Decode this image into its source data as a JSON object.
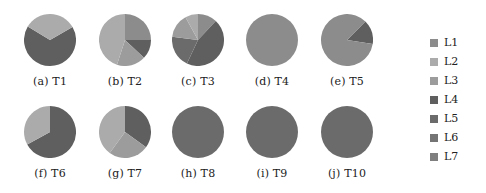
{
  "chart_data": [
    {
      "type": "pie",
      "title": "(a) T1",
      "labels": [
        "L4",
        "L2"
      ],
      "values": [
        67,
        33
      ]
    },
    {
      "type": "pie",
      "title": "(b) T2",
      "labels": [
        "L1",
        "L4",
        "L3",
        "L2"
      ],
      "values": [
        25,
        12,
        18,
        45
      ]
    },
    {
      "type": "pie",
      "title": "(c) T3",
      "labels": [
        "L1",
        "L4",
        "L5",
        "L3",
        "L2"
      ],
      "values": [
        12,
        45,
        20,
        15,
        8
      ]
    },
    {
      "type": "pie",
      "title": "(d) T4",
      "labels": [
        "L1"
      ],
      "values": [
        100
      ]
    },
    {
      "type": "pie",
      "title": "(e) T5",
      "labels": [
        "L4",
        "L1"
      ],
      "values": [
        15,
        85
      ]
    },
    {
      "type": "pie",
      "title": "(f) T6",
      "labels": [
        "L4",
        "L2"
      ],
      "values": [
        67,
        33
      ]
    },
    {
      "type": "pie",
      "title": "(g) T7",
      "labels": [
        "L4",
        "L3",
        "L2"
      ],
      "values": [
        35,
        25,
        40
      ]
    },
    {
      "type": "pie",
      "title": "(h) T8",
      "labels": [
        "L5"
      ],
      "values": [
        100
      ]
    },
    {
      "type": "pie",
      "title": "(i) T9",
      "labels": [
        "L5"
      ],
      "values": [
        100
      ]
    },
    {
      "type": "pie",
      "title": "(j) T10",
      "labels": [
        "L5"
      ],
      "values": [
        100
      ]
    }
  ],
  "legend": {
    "position": "right",
    "items": [
      {
        "label": "L1",
        "color": "#8c8c8c"
      },
      {
        "label": "L2",
        "color": "#ababab"
      },
      {
        "label": "L3",
        "color": "#9c9c9c"
      },
      {
        "label": "L4",
        "color": "#5f5f5f"
      },
      {
        "label": "L5",
        "color": "#6b6b6b"
      },
      {
        "label": "L6",
        "color": "#747474"
      },
      {
        "label": "L7",
        "color": "#7f7f7f"
      }
    ]
  },
  "layout": {
    "radius": 26,
    "positions": [
      {
        "x": 50,
        "y": 40
      },
      {
        "x": 125,
        "y": 40
      },
      {
        "x": 198,
        "y": 40
      },
      {
        "x": 272,
        "y": 40
      },
      {
        "x": 347,
        "y": 40
      },
      {
        "x": 50,
        "y": 132
      },
      {
        "x": 125,
        "y": 132
      },
      {
        "x": 198,
        "y": 132
      },
      {
        "x": 272,
        "y": 132
      },
      {
        "x": 347,
        "y": 132
      }
    ],
    "start_angles": [
      -30,
      -90,
      -90,
      -90,
      -45,
      -90,
      -90,
      -90,
      -90,
      -90
    ]
  }
}
